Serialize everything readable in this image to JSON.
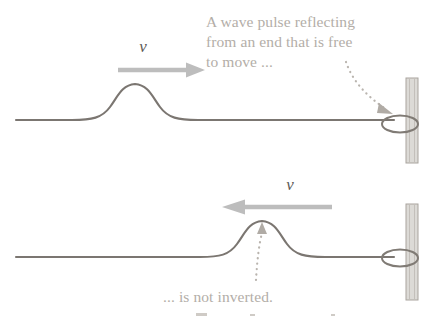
{
  "figure": {
    "width": 437,
    "height": 316,
    "background_color": "#ffffff"
  },
  "colors": {
    "rope": "#7b7671",
    "annotation_text": "#b3aea8",
    "velocity_label": "#5e5a56",
    "velocity_arrow": "#bdbdbd",
    "post_fill": "#dcdad6",
    "post_edge": "#a9a49e",
    "ring": "#807b75",
    "leader": "#b9b4ae"
  },
  "annotations": {
    "top": {
      "name": "top-annotation",
      "lines": [
        "A wave pulse reflecting",
        "from an end that is free",
        "to move ..."
      ],
      "full_text": "A wave pulse reflecting from an end that is free to move ...",
      "color": "#b3aea8"
    },
    "bottom": {
      "name": "bottom-annotation",
      "lines": [
        "... is not inverted."
      ],
      "full_text": "... is not inverted.",
      "color": "#b3aea8"
    }
  },
  "panels": [
    {
      "id": "panel-incident",
      "label": "incident pulse travelling toward the free end",
      "baseline_y": 120,
      "rope_start_x": 16,
      "rope_end_x": 396,
      "pulse": {
        "peak_x": 135,
        "peak_y": 83,
        "amplitude": 37,
        "orientation": "upright"
      },
      "velocity": {
        "symbol": "v",
        "direction": "right",
        "label_x": 143,
        "label_y": 52,
        "arrow_from_x": 118,
        "arrow_to_x": 205,
        "arrow_y": 70
      },
      "boundary": {
        "type": "free-end-ring-on-post",
        "post_x": 412,
        "post_top_y": 78,
        "post_bottom_y": 163,
        "ring_cx": 400,
        "ring_cy": 124
      },
      "leader": {
        "present": true,
        "from_x": 346,
        "from_y": 62,
        "to_x": 392,
        "to_y": 113,
        "style": "dotted-curved-arrow"
      }
    },
    {
      "id": "panel-reflected",
      "label": "reflected pulse travelling back, not inverted",
      "baseline_y": 257,
      "rope_start_x": 16,
      "rope_end_x": 396,
      "pulse": {
        "peak_x": 262,
        "peak_y": 220,
        "amplitude": 37,
        "orientation": "upright"
      },
      "velocity": {
        "symbol": "v",
        "direction": "left",
        "label_x": 290,
        "label_y": 190,
        "arrow_from_x": 332,
        "arrow_to_x": 222,
        "arrow_y": 207
      },
      "boundary": {
        "type": "free-end-ring-on-post",
        "post_x": 412,
        "post_top_y": 204,
        "post_bottom_y": 300,
        "ring_cx": 400,
        "ring_cy": 258
      },
      "leader": {
        "present": true,
        "from_x": 258,
        "from_y": 278,
        "to_x": 262,
        "to_y": 228,
        "style": "dotted-straight-arrow"
      }
    }
  ],
  "physics": {
    "concept": "reflection of a transverse wave pulse at a free boundary",
    "result": "not inverted"
  }
}
